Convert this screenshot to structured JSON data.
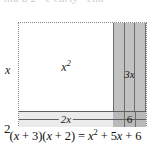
{
  "figure": {
    "kind": "area-model-rectangle-diagram",
    "top_bleed_text": "ind    a   2   ·  e   early  ·  elm",
    "dimension_labels": {
      "top_left": "x",
      "top_right": "3",
      "left_top": "x",
      "left_bottom": "2"
    },
    "cells": [
      {
        "id": "x2",
        "label": "x²",
        "position": "top-left",
        "fill": "#ffffff"
      },
      {
        "id": "3x",
        "label": "3x",
        "position": "top-right",
        "fill": "#c2c2c2"
      },
      {
        "id": "2x",
        "label": "2x",
        "position": "bottom-left",
        "fill": "#ebebeb"
      },
      {
        "id": "6",
        "label": "6",
        "position": "bottom-right",
        "fill": "#b9b9b9"
      }
    ],
    "cell_labels": {
      "x_squared": "x",
      "x_squared_exp": "2",
      "three_x": "3x",
      "two_x": "2x",
      "six": "6"
    },
    "equation": {
      "left_factor_open": "(",
      "full": "(x + 3)(x + 2) = x² + 5x + 6",
      "lhs_a": "x",
      "lhs_a_rest": " + 3)(",
      "lhs_b": "x",
      "lhs_b_rest": " + 2) = ",
      "rhs_x": "x",
      "rhs_exp": "2",
      "rhs_rest_1": " + 5",
      "rhs_x2": "x",
      "rhs_rest_2": " + 6"
    },
    "colors": {
      "gray_dark": "#b9b9b9",
      "gray_mid": "#c2c2c2",
      "gray_light": "#ebebeb",
      "line": "#5f5f5f",
      "dotted_border": "#8a8a8a",
      "text": "#1a1a1a"
    }
  }
}
